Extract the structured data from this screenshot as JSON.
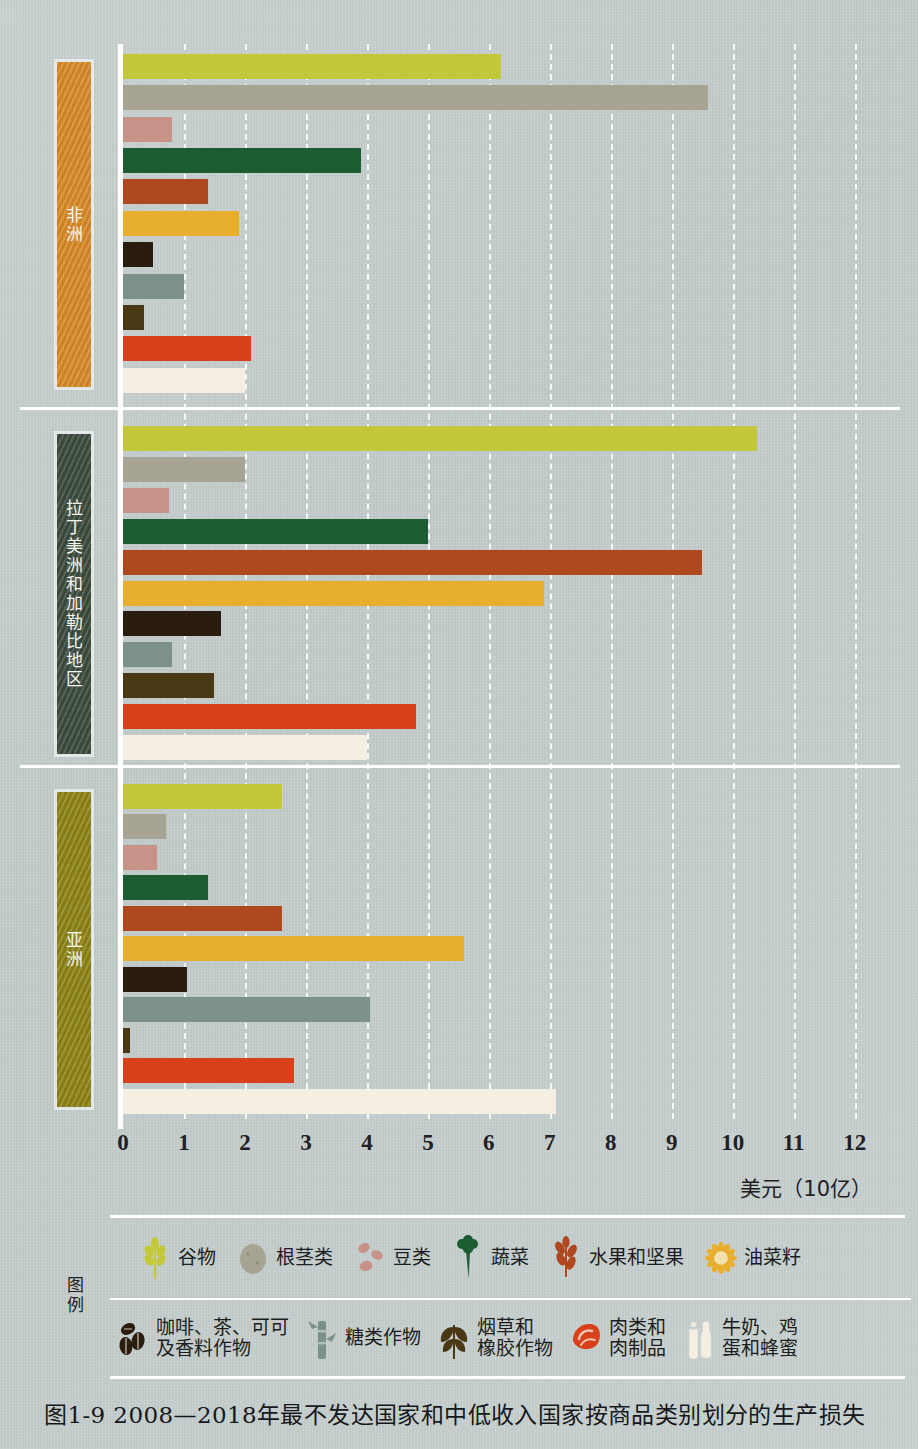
{
  "figure": {
    "caption": "图1-9  2008—2018年最不发达国家和中低收入国家按商品类别划分的生产损失",
    "axis_unit_label": "美元（10亿）",
    "legend_title": "图例"
  },
  "axis": {
    "ticks": [
      "0",
      "1",
      "2",
      "3",
      "4",
      "5",
      "6",
      "7",
      "8",
      "9",
      "10",
      "11",
      "12"
    ],
    "min": 0,
    "max": 12.3
  },
  "categories": [
    {
      "key": "cereals",
      "label": "谷物",
      "color": "#c3c83a"
    },
    {
      "key": "roots",
      "label": "根茎类",
      "color": "#a8a493"
    },
    {
      "key": "pulses",
      "label": "豆类",
      "color": "#c79287"
    },
    {
      "key": "vegetables",
      "label": "蔬菜",
      "color": "#1c5c31"
    },
    {
      "key": "fruits",
      "label": "水果和坚果",
      "color": "#b0481f"
    },
    {
      "key": "oilseeds",
      "label": "油菜籽",
      "color": "#e8ae2e"
    },
    {
      "key": "coffee",
      "label": "咖啡、茶、可可\n及香料作物",
      "color": "#2b1c10"
    },
    {
      "key": "sugar",
      "label": "糖类作物",
      "color": "#7c918c"
    },
    {
      "key": "tobacco",
      "label": "烟草和\n橡胶作物",
      "color": "#4a3716"
    },
    {
      "key": "meat",
      "label": "肉类和\n肉制品",
      "color": "#d8401c"
    },
    {
      "key": "milk",
      "label": "牛奶、鸡\n蛋和蜂蜜",
      "color": "#f4efe2"
    }
  ],
  "regions": [
    {
      "key": "africa",
      "label": "非洲",
      "band_color": "#d98a28"
    },
    {
      "key": "lac",
      "label": "拉丁美洲和加勒比地区",
      "band_color": "#3d4c3f"
    },
    {
      "key": "asia",
      "label": "亚洲",
      "band_color": "#8d8418"
    }
  ],
  "chart_data": {
    "type": "bar",
    "orientation": "horizontal",
    "title": "图1-9  2008—2018年最不发达国家和中低收入国家按商品类别划分的生产损失",
    "xlabel": "美元（10亿）",
    "ylabel": "",
    "xlim": [
      0,
      12.3
    ],
    "grid": true,
    "legend_position": "bottom",
    "categories": [
      "谷物",
      "根茎类",
      "豆类",
      "蔬菜",
      "水果和坚果",
      "油菜籽",
      "咖啡、茶、可可及香料作物",
      "糖类作物",
      "烟草和橡胶作物",
      "肉类和肉制品",
      "牛奶、鸡蛋和蜂蜜"
    ],
    "groups": [
      {
        "name": "非洲",
        "values": [
          6.2,
          9.6,
          0.8,
          3.9,
          1.4,
          1.9,
          0.5,
          1.0,
          0.35,
          2.1,
          2.0
        ]
      },
      {
        "name": "拉丁美洲和加勒比地区",
        "values": [
          10.4,
          2.0,
          0.75,
          5.0,
          9.5,
          6.9,
          1.6,
          0.8,
          1.5,
          4.8,
          4.0
        ]
      },
      {
        "name": "亚洲",
        "values": [
          2.6,
          0.7,
          0.55,
          1.4,
          2.6,
          5.6,
          1.05,
          4.05,
          0.12,
          2.8,
          7.1
        ]
      }
    ]
  }
}
